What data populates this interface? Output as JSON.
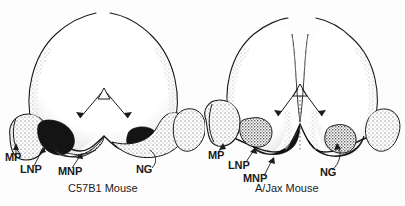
{
  "figure": {
    "type": "anatomical-line-drawing",
    "background_color": "#fdfdfd",
    "ink_color": "#1a1a1a",
    "stipple_color": "#3a3a3a",
    "dark_shading_color": "#141414"
  },
  "panels": [
    {
      "id": "left",
      "caption": "C57B1 Mouse",
      "labels": [
        {
          "key": "mp",
          "text": "MP",
          "x": 5,
          "y": 158
        },
        {
          "key": "lnp",
          "text": "LNP",
          "x": 22,
          "y": 170
        },
        {
          "key": "mnp",
          "text": "MNP",
          "x": 58,
          "y": 172
        },
        {
          "key": "ng",
          "text": "NG",
          "x": 140,
          "y": 170
        }
      ],
      "midline_marker": {
        "type": "triangle-with-diverging-arrows",
        "apex_x": 104,
        "apex_y": 92
      },
      "midline_dotted": false
    },
    {
      "id": "right",
      "caption": "A/Jax Mouse",
      "labels": [
        {
          "key": "mp",
          "text": "MP",
          "x": 208,
          "y": 155
        },
        {
          "key": "lnp",
          "text": "LNP",
          "x": 228,
          "y": 165
        },
        {
          "key": "mnp",
          "text": "MNP",
          "x": 243,
          "y": 178
        },
        {
          "key": "ng",
          "text": "NG",
          "x": 320,
          "y": 172
        }
      ],
      "midline_marker": {
        "type": "triangle-with-diverging-arrows",
        "apex_x": 288,
        "apex_y": 88
      },
      "midline_dotted": true
    }
  ],
  "legend_keys": {
    "MP": "maxillary process",
    "LNP": "lateral nasal process",
    "MNP": "medial nasal process",
    "NG": "nasal groove"
  }
}
